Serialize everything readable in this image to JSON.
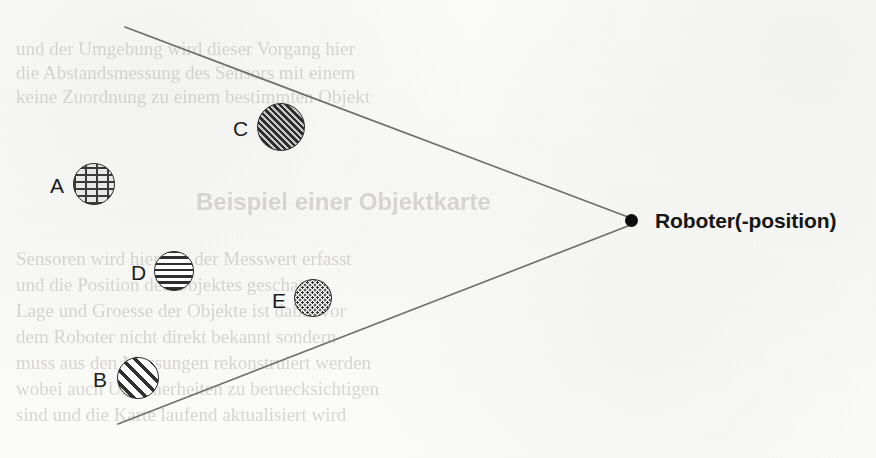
{
  "page": {
    "width": 876,
    "height": 458,
    "background_color": "#fbfbfa",
    "ink_color": "#2b2b2b"
  },
  "figure": {
    "kind": "robot-sensor-field-of-view-diagram",
    "robot": {
      "label": "Roboter(-position)",
      "marker": "filled-dot",
      "marker_color": "#0d0d0d",
      "x": 631,
      "y": 220
    },
    "cone": {
      "description": "two straight lines converging at the robot position forming a wedge / field of view opening to the left",
      "line_color": "#6f6f6f",
      "upper_line": {
        "x1": 125,
        "y1": 27,
        "x2": 628,
        "y2": 217
      },
      "lower_line": {
        "x1": 118,
        "y1": 424,
        "x2": 628,
        "y2": 226
      }
    },
    "objects": [
      {
        "id": "A",
        "label": "A",
        "pattern": "brick",
        "cx": 94,
        "cy": 184,
        "r": 21,
        "label_x": 50,
        "label_y": 175
      },
      {
        "id": "C",
        "label": "C",
        "pattern": "diagonal-dense",
        "cx": 281,
        "cy": 127,
        "r": 24,
        "label_x": 233,
        "label_y": 118
      },
      {
        "id": "D",
        "label": "D",
        "pattern": "horizontal-lines",
        "cx": 174,
        "cy": 271,
        "r": 20,
        "label_x": 131,
        "label_y": 262
      },
      {
        "id": "E",
        "label": "E",
        "pattern": "stipple-dots",
        "cx": 313,
        "cy": 298,
        "r": 19,
        "label_x": 272,
        "label_y": 290
      },
      {
        "id": "B",
        "label": "B",
        "pattern": "diagonal-coarse",
        "cx": 138,
        "cy": 378,
        "r": 21,
        "label_x": 93,
        "label_y": 369
      }
    ]
  },
  "bleed_through": {
    "note": "faint mirrored show-through text from the reverse side of the scanned sheet; not legible",
    "lines": [
      {
        "text": "und der  Umgebung  wird  dieser  Vorgang  hier",
        "x": 16,
        "y": 38,
        "size": 19,
        "style": "serif"
      },
      {
        "text": "die  Abstandsmessung  des  Sensors  mit  einem",
        "x": 16,
        "y": 62,
        "size": 19,
        "style": "serif"
      },
      {
        "text": "keine  Zuordnung  zu  einem  bestimmten  Objekt",
        "x": 16,
        "y": 86,
        "size": 19,
        "style": "serif"
      },
      {
        "text": "Beispiel  einer  Objektkarte",
        "x": 196,
        "y": 188,
        "size": 24,
        "style": "sans-bold"
      },
      {
        "text": "Sensoren  wird  hier  nur  der  Messwert  erfasst",
        "x": 16,
        "y": 248,
        "size": 19,
        "style": "serif"
      },
      {
        "text": "und  die  Position  des  Objektes  geschaetzt",
        "x": 16,
        "y": 274,
        "size": 19,
        "style": "serif"
      },
      {
        "text": "Lage  und  Groesse  der  Objekte  ist  dabei  vor",
        "x": 16,
        "y": 300,
        "size": 19,
        "style": "serif"
      },
      {
        "text": "dem  Roboter  nicht  direkt  bekannt  sondern",
        "x": 16,
        "y": 326,
        "size": 19,
        "style": "serif"
      },
      {
        "text": "muss  aus  den  Messungen  rekonstruiert  werden",
        "x": 16,
        "y": 352,
        "size": 19,
        "style": "serif"
      },
      {
        "text": "wobei  auch  Unsicherheiten  zu  beruecksichtigen",
        "x": 16,
        "y": 378,
        "size": 19,
        "style": "serif"
      },
      {
        "text": "sind  und  die  Karte  laufend  aktualisiert  wird",
        "x": 16,
        "y": 404,
        "size": 19,
        "style": "serif"
      }
    ]
  }
}
